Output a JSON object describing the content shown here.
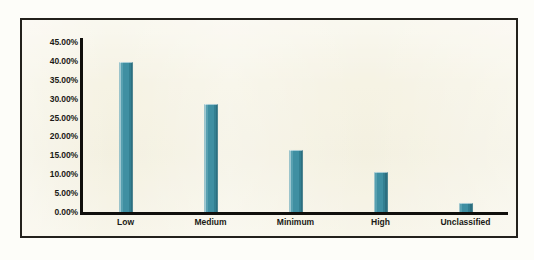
{
  "chart_data": {
    "type": "bar",
    "title": "",
    "subtitle": "",
    "xlabel": "",
    "ylabel": "",
    "categories": [
      "Low",
      "Medium",
      "Minimum",
      "High",
      "Unclassified"
    ],
    "values": [
      39.7,
      28.7,
      16.4,
      10.7,
      2.3
    ],
    "value_labels": [
      "39.70%",
      "28.70%",
      "16.40%",
      "10.70%",
      "2.30%"
    ],
    "ylim": [
      0,
      45
    ],
    "y_tick_step": 5,
    "y_tick_labels": [
      "45.00%",
      "40.00%",
      "35.00%",
      "30.00%",
      "25.00%",
      "20.00%",
      "15.00%",
      "10.00%",
      "5.00%",
      "0.00%"
    ],
    "y_tick_values": [
      45,
      40,
      35,
      30,
      25,
      20,
      15,
      10,
      5,
      0
    ],
    "grid": false,
    "legend": null,
    "legend_position": "none",
    "annotations": [],
    "series": [
      {
        "name": "Percentage",
        "values": [
          39.7,
          28.7,
          16.4,
          10.7,
          2.3
        ]
      }
    ]
  },
  "style": {
    "bar_color": "#3e8ea1",
    "bar_highlight_color": "#9fc9d3",
    "bar_shadow_color": "#2c6f80",
    "axis_color": "#100f0c",
    "frame_color": "#23211c",
    "plot_background": "#f6f3e4",
    "page_background": "#fdfdf9",
    "label_color": "#1b1a16"
  }
}
